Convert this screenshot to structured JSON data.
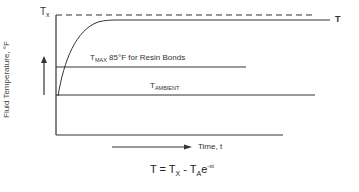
{
  "diagram": {
    "labels": {
      "tx": "T",
      "tx_sub": "x",
      "t_curve": "T",
      "tmax": "T",
      "tmax_sub": "MAX",
      "tmax_text": " 85°F for Resin Bonds",
      "tambient": "T",
      "tambient_sub": "AMBIENT",
      "y_axis": "Fluid Temperature, °F",
      "x_axis": "Time, t"
    },
    "formula": {
      "lhs": "T = T",
      "sub_x": "X",
      "mid": " - T",
      "sub_a": "A",
      "base": "e",
      "exp": "-xt"
    },
    "colors": {
      "line": "#333333",
      "background": "#ffffff"
    }
  }
}
